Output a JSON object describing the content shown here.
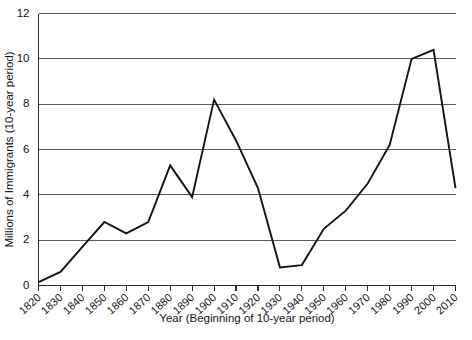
{
  "chart_data": {
    "type": "line",
    "title": "",
    "subtitle": "",
    "xlabel": "Year (Beginning of 10-year period)",
    "ylabel": "Millions of Immigrants (10-year period)",
    "x": [
      1820,
      1830,
      1840,
      1850,
      1860,
      1870,
      1880,
      1890,
      1900,
      1910,
      1920,
      1930,
      1940,
      1950,
      1960,
      1970,
      1980,
      1990,
      2000,
      2010
    ],
    "categories": [
      "1820",
      "1830",
      "1840",
      "1850",
      "1860",
      "1870",
      "1880",
      "1890",
      "1900",
      "1910",
      "1920",
      "1930",
      "1940",
      "1950",
      "1960",
      "1970",
      "1980",
      "1990",
      "2000",
      "2010"
    ],
    "values": [
      0.15,
      0.6,
      1.7,
      2.8,
      2.3,
      2.8,
      5.3,
      3.9,
      8.2,
      6.4,
      4.3,
      0.8,
      0.9,
      2.5,
      3.3,
      4.5,
      6.2,
      10.0,
      10.4,
      4.3
    ],
    "series": [
      {
        "name": "Immigrants",
        "values": [
          0.15,
          0.6,
          1.7,
          2.8,
          2.3,
          2.8,
          5.3,
          3.9,
          8.2,
          6.4,
          4.3,
          0.8,
          0.9,
          2.5,
          3.3,
          4.5,
          6.2,
          10.0,
          10.4,
          4.3
        ],
        "color": "#141414"
      }
    ],
    "xlim": [
      1820,
      2010
    ],
    "ylim": [
      0,
      12
    ],
    "ytick_labels": [
      "0",
      "2",
      "4",
      "6",
      "8",
      "10",
      "12"
    ],
    "ytick_values": [
      0,
      2,
      4,
      6,
      8,
      10,
      12
    ],
    "grid": true,
    "grid_axis": "y",
    "legend": false,
    "legend_position": "none",
    "annotations": []
  }
}
